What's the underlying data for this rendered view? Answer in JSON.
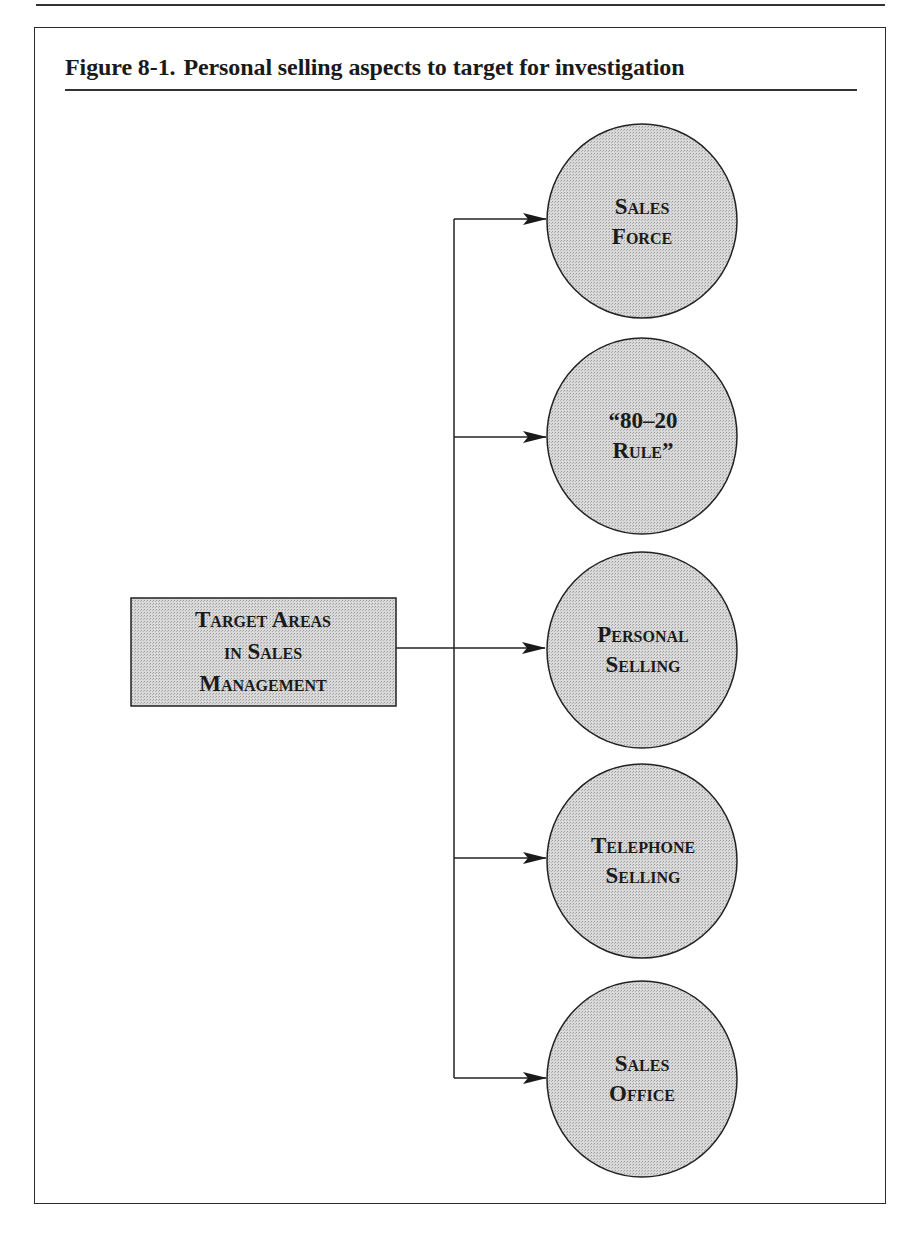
{
  "figure": {
    "number": "Figure 8-1.",
    "title": "Personal selling aspects to target for investigation"
  },
  "root": {
    "line1": "Target Areas",
    "line2": "in Sales",
    "line3": "Management"
  },
  "targets": [
    {
      "line1": "Sales",
      "line2": "Force"
    },
    {
      "line1": "“80–20",
      "line2": "Rule”"
    },
    {
      "line1": "Personal",
      "line2": "Selling"
    },
    {
      "line1": "Telephone",
      "line2": "Selling"
    },
    {
      "line1": "Sales",
      "line2": "Office"
    }
  ],
  "colors": {
    "node_fill": "#d2d2d2",
    "stroke": "#222222"
  }
}
